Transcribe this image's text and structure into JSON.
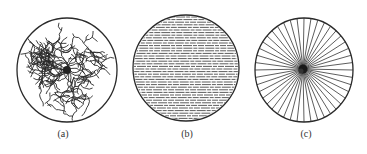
{
  "figure": {
    "panels": [
      {
        "id": "a",
        "label": "(a)",
        "pattern": "dendritic-cracks",
        "cx": 67,
        "cy": 70,
        "rx": 50,
        "ry": 52,
        "label_x": 63
      },
      {
        "id": "b",
        "label": "(b)",
        "pattern": "horizontal-parallel-lines",
        "cx": 186,
        "cy": 68,
        "rx": 53,
        "ry": 53,
        "label_x": 187
      },
      {
        "id": "c",
        "label": "(c)",
        "pattern": "radial-spokes",
        "cx": 304,
        "cy": 70,
        "rx": 49,
        "ry": 52,
        "label_x": 306
      }
    ],
    "label_y": 128,
    "stroke_color": "#2a2a2a"
  }
}
